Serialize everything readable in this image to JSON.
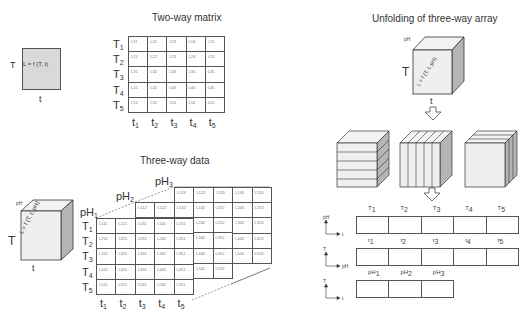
{
  "two_way": {
    "title": "Two-way matrix",
    "square_formula": "L = f (T, t)",
    "square_y_axis": "T",
    "square_x_axis": "t",
    "rows": [
      "T1",
      "T2",
      "T3",
      "T4",
      "T5"
    ],
    "cols": [
      "t1",
      "t2",
      "t3",
      "t4",
      "t5"
    ],
    "cells": [
      [
        "L11",
        "L12",
        "L13",
        "L14",
        "L15"
      ],
      [
        "L21",
        "L22",
        "L23",
        "L24",
        "L25"
      ],
      [
        "L31",
        "L32",
        "L33",
        "L34",
        "L35"
      ],
      [
        "L41",
        "L42",
        "L43",
        "L44",
        "L45"
      ],
      [
        "L51",
        "L52",
        "L53",
        "L54",
        "L55"
      ]
    ]
  },
  "three_way": {
    "title": "Three-way data",
    "cube_formula": "L = f (T, t, pH)",
    "cube_depth_axis": "pH",
    "cube_y_axis": "T",
    "cube_x_axis": "t",
    "layers": [
      "pH1",
      "pH2",
      "pH3"
    ],
    "rows": [
      "T1",
      "T2",
      "T3",
      "T4",
      "T5"
    ],
    "cols": [
      "t1",
      "t2",
      "t3",
      "t4",
      "t5"
    ]
  },
  "unfolding": {
    "title": "Unfolding of three-way array",
    "cube_formula": "L = f (T, t, pH)",
    "cube_depth_axis": "pH",
    "cube_y_axis": "T",
    "cube_x_axis": "t",
    "strips": [
      {
        "y_axis": "pH",
        "x_axis": "t",
        "labels": [
          "T1",
          "T2",
          "T3",
          "T4",
          "T5"
        ]
      },
      {
        "y_axis": "T",
        "x_axis": "pH",
        "labels": [
          "t1",
          "t2",
          "t3",
          "t4",
          "t5"
        ]
      },
      {
        "y_axis": "T",
        "x_axis": "t",
        "labels": [
          "pH1",
          "pH2",
          "pH3"
        ]
      }
    ]
  }
}
